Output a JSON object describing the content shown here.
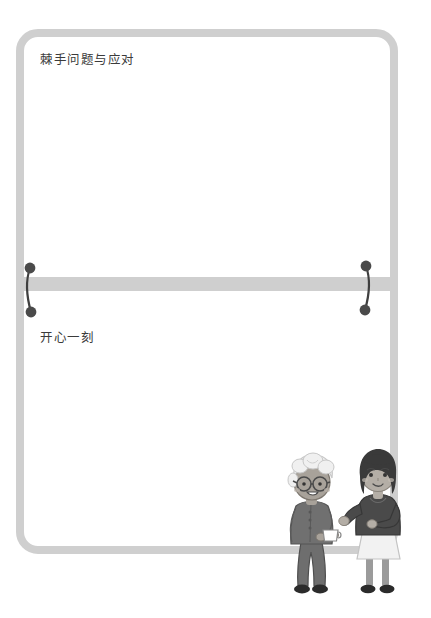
{
  "page": {
    "background_color": "#ffffff",
    "width": 431,
    "height": 618
  },
  "frame": {
    "border_color": "#cfcfcf",
    "border_width_px": 8,
    "corner_radius_px": 22,
    "fill": "transparent"
  },
  "divider": {
    "name": "horizontal-divider-bar",
    "color": "#cfcfcf",
    "height_px": 14
  },
  "clips": [
    {
      "position": "left",
      "dot_color": "#4a4a4a",
      "wire_color": "#3f3f3f"
    },
    {
      "position": "right",
      "dot_color": "#4a4a4a",
      "wire_color": "#3f3f3f"
    }
  ],
  "sections": {
    "top": {
      "title": "棘手问题与应对",
      "title_color": "#3b3b3b",
      "body": ""
    },
    "bottom": {
      "title": "开心一刻",
      "title_color": "#3b3b3b",
      "body": ""
    }
  },
  "illustration": {
    "name": "two-women-conversation",
    "description": "老年女性手持杯子与年轻女性交谈",
    "figures": [
      {
        "name": "elderly-woman",
        "hair": "白色卷发",
        "hair_color": "#f0f0f0",
        "glasses": true,
        "top_color": "#707070",
        "pants_color": "#6e6e6e",
        "shoes_color": "#2b2b2b",
        "skin_color": "#a8a29a",
        "holding": "cup",
        "cup_color": "#ffffff"
      },
      {
        "name": "young-woman",
        "hair": "深色波波头",
        "hair_color": "#3a3a3a",
        "top_color": "#4a4a4a",
        "skirt_color": "#f2f2f2",
        "legs_color": "#9b9b9b",
        "shoes_color": "#2b2b2b",
        "skin_color": "#b4aea6"
      }
    ]
  }
}
